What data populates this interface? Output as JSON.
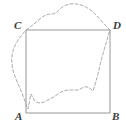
{
  "figure": {
    "kind": "geometry-diagram",
    "background_color": "#ffffff",
    "square": {
      "name": "square-ABCD",
      "stroke_color": "#8c8c8c",
      "stroke_width": 0.9,
      "fill": "none",
      "left": 26,
      "top": 30,
      "right": 110,
      "bottom": 113,
      "vertices": [
        {
          "id": "A",
          "label": "A",
          "x": 26,
          "y": 113,
          "position": "bottom-left"
        },
        {
          "id": "B",
          "label": "B",
          "x": 110,
          "y": 113,
          "position": "bottom-right"
        },
        {
          "id": "C",
          "label": "C",
          "x": 26,
          "y": 30,
          "position": "top-left"
        },
        {
          "id": "D",
          "label": "D",
          "x": 110,
          "y": 30,
          "position": "top-right"
        }
      ]
    },
    "dashed_curve": {
      "name": "dashed-region-outline",
      "stroke_color": "#a8a8a8",
      "stroke_width": 1,
      "dash_pattern": "3 2.2",
      "fill": "none",
      "closed": true,
      "path": "M 26 30 C 32 26 36 22 41 18 C 45 15 48 14 52 14 C 55 14 57 12 60 9 C 64 5 70 3 76 4 C 83 5 89 8 94 13 C 99 18 105 25 110 30 C 109 33 108 36 107 40 C 104 50 101 60 99 70 C 97 78 95 85 93 91 C 90 88 86 85 82 88 C 78 91 74 90 70 90 C 66 90 62 91 58 94 C 54 97 50 99 46 101 C 42 103 38 104 35 101 C 33 98 32 96 31 94 C 30 98 29 104 28 109 C 27 107 26 104 25 101 C 22 93 19 86 16 79 C 13 72 11 64 12 56 C 13 48 17 41 21 36 C 23 34 24 32 26 30 Z"
    },
    "labels": {
      "A": "A",
      "B": "B",
      "C": "C",
      "D": "D"
    }
  }
}
